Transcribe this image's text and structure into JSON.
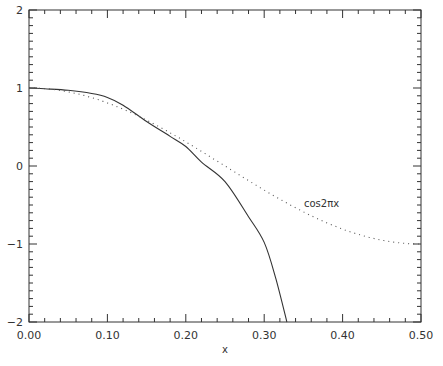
{
  "chart_data": {
    "type": "line",
    "title": "",
    "xlabel": "x",
    "ylabel": "",
    "xlim": [
      0.0,
      0.5
    ],
    "ylim": [
      -2,
      2
    ],
    "grid": false,
    "legend": null,
    "x_ticks": [
      "0.00",
      "0.10",
      "0.20",
      "0.30",
      "0.40",
      "0.50"
    ],
    "x_tick_values": [
      0.0,
      0.1,
      0.2,
      0.3,
      0.4,
      0.5
    ],
    "y_ticks": [
      "-2",
      "-1",
      "0",
      "1",
      "2"
    ],
    "y_tick_values": [
      -2,
      -1,
      0,
      1,
      2
    ],
    "annotations": [
      {
        "text": "cos2πx",
        "x": 0.35,
        "y": -0.47,
        "refers_to": "cos2πx"
      }
    ],
    "series": [
      {
        "name": "approximation",
        "style": "solid",
        "color": "#333333",
        "x": [
          0.0,
          0.02,
          0.05,
          0.08,
          0.1,
          0.12,
          0.15,
          0.18,
          0.2,
          0.22,
          0.25,
          0.28,
          0.3,
          0.315,
          0.329
        ],
        "y": [
          1.0,
          0.99,
          0.97,
          0.93,
          0.88,
          0.78,
          0.57,
          0.38,
          0.25,
          0.05,
          -0.2,
          -0.65,
          -0.98,
          -1.45,
          -2.0
        ]
      },
      {
        "name": "cos2πx",
        "style": "dotted",
        "color": "#555555",
        "x": [
          0.0,
          0.05,
          0.1,
          0.15,
          0.2,
          0.25,
          0.3,
          0.35,
          0.4,
          0.45,
          0.5
        ],
        "y": [
          1.0,
          0.951,
          0.809,
          0.588,
          0.309,
          0.0,
          -0.309,
          -0.588,
          -0.809,
          -0.951,
          -1.0
        ]
      }
    ]
  },
  "labels": {
    "x_axis_title": "x",
    "annotation": "cos2πx"
  }
}
